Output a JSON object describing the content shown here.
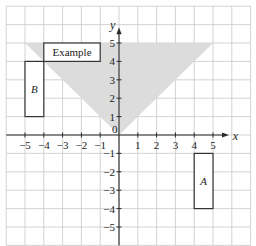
{
  "diagram": {
    "type": "coordinate-grid-transformation",
    "axes": {
      "x_label": "x",
      "y_label": "y",
      "origin_label": "0",
      "x_range": [
        -6,
        7
      ],
      "y_range": [
        -6,
        7
      ],
      "x_ticks": [
        "-5",
        "-4",
        "-3",
        "-2",
        "-1",
        "1",
        "2",
        "3",
        "4",
        "5"
      ],
      "y_ticks": [
        "5",
        "4",
        "3",
        "2",
        "1",
        "-1",
        "-2",
        "-3",
        "-4",
        "-5"
      ]
    },
    "shaded_region": {
      "description": "Triangle y >= |x| bounded by y = 5",
      "vertices": [
        [
          -5,
          5
        ],
        [
          5,
          5
        ],
        [
          0,
          0
        ]
      ],
      "color": "#dcdcdc"
    },
    "shapes": [
      {
        "id": "example",
        "label": "Example",
        "x1": -4,
        "y1": 4,
        "x2": -1,
        "y2": 5
      },
      {
        "id": "B",
        "label": "B",
        "x1": -5,
        "y1": 1,
        "x2": -4,
        "y2": 4
      },
      {
        "id": "A",
        "label": "A",
        "x1": 4,
        "y1": -4,
        "x2": 5,
        "y2": -1
      }
    ]
  }
}
